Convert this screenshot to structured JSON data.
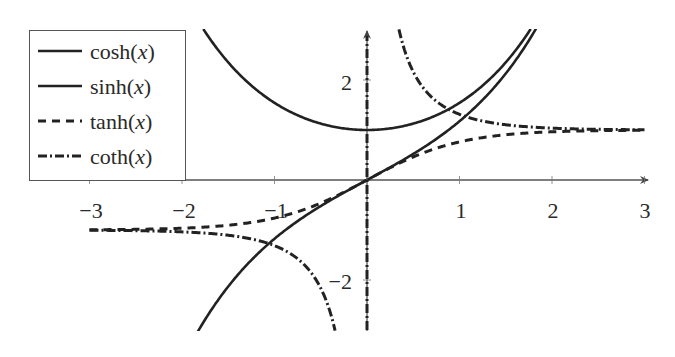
{
  "chart_data": {
    "type": "line",
    "title": "",
    "xlabel": "",
    "ylabel": "",
    "xlim": [
      -3,
      3
    ],
    "ylim": [
      -3,
      3
    ],
    "grid": false,
    "legend_position": "upper left",
    "x_ticks": [
      -3,
      -2,
      -1,
      1,
      2,
      3
    ],
    "x_tick_labels": [
      "−3",
      "−2",
      "−1",
      "1",
      "2",
      "3"
    ],
    "y_ticks": [
      2,
      -2
    ],
    "y_tick_labels": [
      "2",
      "−2"
    ],
    "series": [
      {
        "name": "cosh(x)",
        "func": "cosh",
        "style": "solid",
        "color": "#222222",
        "x": [
          -1.75,
          -1.5,
          -1,
          -0.5,
          0,
          0.5,
          1,
          1.5,
          1.75
        ],
        "values": [
          2.96,
          2.35,
          1.54,
          1.13,
          1.0,
          1.13,
          1.54,
          2.35,
          2.96
        ]
      },
      {
        "name": "sinh(x)",
        "func": "sinh",
        "style": "solid",
        "color": "#222222",
        "x": [
          -1.82,
          -1.5,
          -1,
          -0.5,
          0,
          0.5,
          1,
          1.5,
          1.82
        ],
        "values": [
          -3.0,
          -2.13,
          -1.18,
          -0.52,
          0,
          0.52,
          1.18,
          2.13,
          3.0
        ]
      },
      {
        "name": "tanh(x)",
        "func": "tanh",
        "style": "dashed",
        "color": "#222222",
        "x": [
          -3,
          -2,
          -1,
          -0.5,
          0,
          0.5,
          1,
          2,
          3
        ],
        "values": [
          -0.995,
          -0.964,
          -0.762,
          -0.462,
          0,
          0.462,
          0.762,
          0.964,
          0.995
        ]
      },
      {
        "name": "coth(x)",
        "func": "coth",
        "style": "dashdot",
        "color": "#222222",
        "x": [
          -3,
          -2,
          -1,
          -0.5,
          -0.35,
          0.35,
          0.5,
          1,
          2,
          3
        ],
        "values": [
          -1.005,
          -1.037,
          -1.313,
          -2.164,
          -2.97,
          2.97,
          2.164,
          1.313,
          1.037,
          1.005
        ],
        "asymptote_x": 0
      }
    ]
  },
  "legend": {
    "items": [
      {
        "label": "cosh",
        "arg": "x",
        "style": "solid"
      },
      {
        "label": "sinh",
        "arg": "x",
        "style": "solid"
      },
      {
        "label": "tanh",
        "arg": "x",
        "style": "dashed"
      },
      {
        "label": "coth",
        "arg": "x",
        "style": "dashdot"
      }
    ]
  },
  "axes": {
    "x_labels": [
      "−3",
      "−2",
      "−1",
      "1",
      "2",
      "3"
    ],
    "y_labels": [
      "2",
      "−2"
    ],
    "axis_color": "#555555",
    "curve_color": "#222222"
  }
}
